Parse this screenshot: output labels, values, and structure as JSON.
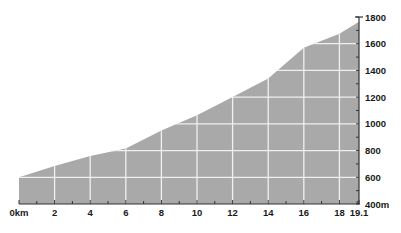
{
  "chart_data": {
    "type": "area",
    "title": "",
    "xlabel": "",
    "ylabel": "",
    "x_unit": "km",
    "y_unit": "m",
    "xlim": [
      0,
      19.1
    ],
    "ylim": [
      400,
      1800
    ],
    "grid": true,
    "legend": null,
    "x_ticks": [
      0,
      2,
      4,
      6,
      8,
      10,
      12,
      14,
      16,
      18,
      19.1
    ],
    "x_tick_labels": [
      "0km",
      "2",
      "4",
      "6",
      "8",
      "10",
      "12",
      "14",
      "16",
      "18",
      "19.1"
    ],
    "y_ticks": [
      400,
      600,
      800,
      1000,
      1200,
      1400,
      1600,
      1800
    ],
    "y_tick_labels": [
      "400m",
      "600",
      "800",
      "1000",
      "1200",
      "1400",
      "1600",
      "1800"
    ],
    "series": [
      {
        "name": "Elevation",
        "x": [
          0,
          2,
          4,
          6,
          8,
          10,
          12,
          14,
          16,
          18,
          19.1
        ],
        "values": [
          600,
          685,
          760,
          815,
          950,
          1065,
          1200,
          1340,
          1570,
          1675,
          1765
        ]
      }
    ],
    "colors": {
      "fill": "#a9a9a9",
      "grid": "#f0f0f0",
      "axis": "#333333",
      "text": "#1a1a1a"
    }
  }
}
